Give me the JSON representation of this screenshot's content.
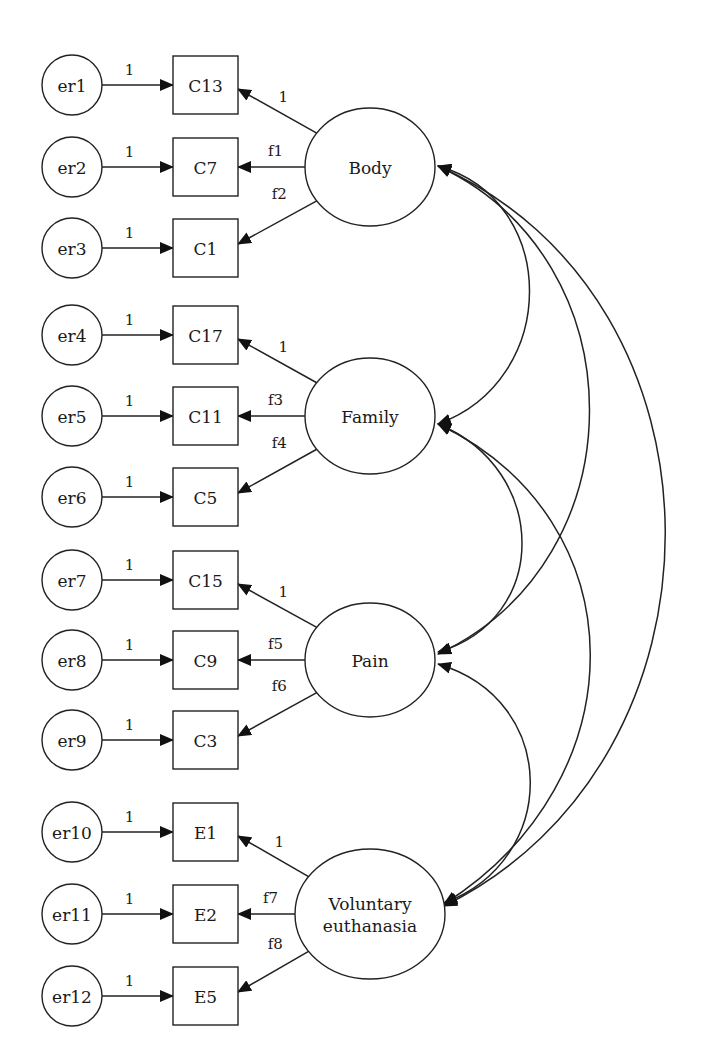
{
  "diagram": {
    "type": "structural-equation-model",
    "colors": {
      "stroke": "#222222",
      "fill": "#ffffff",
      "text": "#1a1a1a"
    },
    "latents": [
      {
        "id": "body",
        "label": [
          "Body"
        ],
        "cx": 370,
        "cy": 167,
        "rx": 65,
        "ry": 59
      },
      {
        "id": "family",
        "label": [
          "Family"
        ],
        "cx": 370,
        "cy": 416,
        "rx": 65,
        "ry": 58
      },
      {
        "id": "pain",
        "label": [
          "Pain"
        ],
        "cx": 370,
        "cy": 660,
        "rx": 65,
        "ry": 57
      },
      {
        "id": "ve",
        "label": [
          "Voluntary",
          "euthanasia"
        ],
        "cx": 370,
        "cy": 914,
        "rx": 75,
        "ry": 65
      }
    ],
    "indicators": [
      {
        "id": "C13",
        "label": "C13",
        "cy": 85,
        "latent": "body",
        "loading": "1",
        "error": "er1",
        "error_weight": "1",
        "pos": "top"
      },
      {
        "id": "C7",
        "label": "C7",
        "cy": 167,
        "latent": "body",
        "loading": "f1",
        "error": "er2",
        "error_weight": "1",
        "pos": "mid"
      },
      {
        "id": "C1",
        "label": "C1",
        "cy": 248,
        "latent": "body",
        "loading": "f2",
        "error": "er3",
        "error_weight": "1",
        "pos": "bot"
      },
      {
        "id": "C17",
        "label": "C17",
        "cy": 335,
        "latent": "family",
        "loading": "1",
        "error": "er4",
        "error_weight": "1",
        "pos": "top"
      },
      {
        "id": "C11",
        "label": "C11",
        "cy": 416,
        "latent": "family",
        "loading": "f3",
        "error": "er5",
        "error_weight": "1",
        "pos": "mid"
      },
      {
        "id": "C5",
        "label": "C5",
        "cy": 497,
        "latent": "family",
        "loading": "f4",
        "error": "er6",
        "error_weight": "1",
        "pos": "bot"
      },
      {
        "id": "C15",
        "label": "C15",
        "cy": 580,
        "latent": "pain",
        "loading": "1",
        "error": "er7",
        "error_weight": "1",
        "pos": "top"
      },
      {
        "id": "C9",
        "label": "C9",
        "cy": 660,
        "latent": "pain",
        "loading": "f5",
        "error": "er8",
        "error_weight": "1",
        "pos": "mid"
      },
      {
        "id": "C3",
        "label": "C3",
        "cy": 740,
        "latent": "pain",
        "loading": "f6",
        "error": "er9",
        "error_weight": "1",
        "pos": "bot"
      },
      {
        "id": "E1",
        "label": "E1",
        "cy": 832,
        "latent": "ve",
        "loading": "1",
        "error": "er10",
        "error_weight": "1",
        "pos": "top"
      },
      {
        "id": "E2",
        "label": "E2",
        "cy": 914,
        "latent": "ve",
        "loading": "f7",
        "error": "er11",
        "error_weight": "1",
        "pos": "mid"
      },
      {
        "id": "E5",
        "label": "E5",
        "cy": 996,
        "latent": "ve",
        "loading": "f8",
        "error": "er12",
        "error_weight": "1",
        "pos": "bot"
      }
    ],
    "layout": {
      "error_cx": 72,
      "error_r": 30,
      "box_x": 173,
      "box_w": 65,
      "box_h": 58
    },
    "covariances": [
      {
        "from": "body",
        "to": "family",
        "path": "M 438 166 C 560 200, 560 380, 438 424"
      },
      {
        "from": "body",
        "to": "pain",
        "path": "M 438 166 C 640 260, 640 560, 438 654"
      },
      {
        "from": "body",
        "to": "ve",
        "path": "M 438 166 C 740 300, 740 760, 444 906"
      },
      {
        "from": "family",
        "to": "pain",
        "path": "M 438 424 C 550 470, 550 620, 438 652"
      },
      {
        "from": "family",
        "to": "ve",
        "path": "M 438 424 C 640 520, 640 780, 444 904"
      },
      {
        "from": "pain",
        "to": "ve",
        "path": "M 438 664 C 560 700, 560 860, 444 903"
      }
    ]
  }
}
